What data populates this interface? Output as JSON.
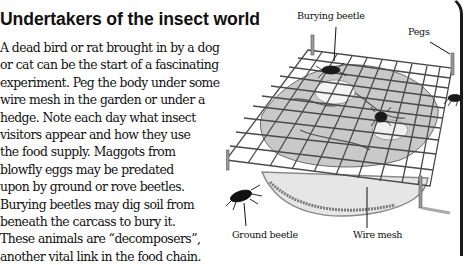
{
  "title": "Undertakers of the insect world",
  "body_lines": [
    "A dead bird or rat brought in by a dog",
    "or cat can be the start of a fascinating",
    "experiment. Peg the body under some",
    "wire mesh in the garden or under a",
    "hedge. Note each day what insect",
    "visitors appear and how they use",
    "the food supply. Maggots from",
    "blowfly eggs may be predated",
    "upon by ground or rove beetles.",
    "Burying beetles may dig soil from",
    "beneath the carcass to bury it.",
    "These animals are “decomposers”,",
    "another vital link in the food chain."
  ],
  "illustration": {
    "labels": {
      "burying_beetle": "Burying beetle",
      "pegs": "Pegs",
      "ground_beetle": "Ground beetle",
      "wire_mesh": "Wire mesh"
    }
  },
  "colors": {
    "text": "#111111",
    "border": "#1a1a1a",
    "mesh": "#4a4a4a",
    "soil": "#9a9a9a"
  }
}
